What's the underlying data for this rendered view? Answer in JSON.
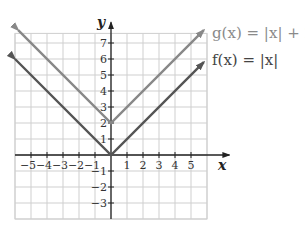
{
  "chart_data": {
    "type": "line",
    "title": "",
    "xlabel": "x",
    "ylabel": "y",
    "xlim": [
      -6,
      6
    ],
    "ylim": [
      -4,
      7.6
    ],
    "grid": true,
    "x_ticks": [
      -5,
      -4,
      -3,
      -2,
      -1,
      1,
      2,
      3,
      4,
      5
    ],
    "y_ticks": [
      -3,
      -2,
      -1,
      1,
      2,
      3,
      4,
      5,
      6,
      7
    ],
    "x_tick_labels": [
      "−5",
      "−4",
      "−3",
      "−2",
      "−1",
      "1",
      "2",
      "3",
      "4",
      "5"
    ],
    "y_tick_labels": [
      "−3",
      "−2",
      "−1",
      "1",
      "2",
      "3",
      "4",
      "5",
      "6",
      "7"
    ],
    "series": [
      {
        "name": "g(x) = |x| + 2",
        "color": "#888888",
        "x": [
          -5.8,
          0,
          5.8
        ],
        "y": [
          7.8,
          2,
          7.8
        ]
      },
      {
        "name": "f(x) = |x|",
        "color": "#555555",
        "x": [
          -6,
          0,
          5.8
        ],
        "y": [
          6,
          0,
          5.8
        ]
      }
    ],
    "legend": [
      {
        "label": "g(x) = |x| + 2",
        "position": "upper right, next to g arrow"
      },
      {
        "label": "f(x) = |x|",
        "position": "right, next to f arrow"
      }
    ]
  },
  "labels": {
    "x_axis": "x",
    "y_axis": "y",
    "g_label": "g(x) = |x| + 2",
    "f_label": "f(x) = |x|"
  }
}
